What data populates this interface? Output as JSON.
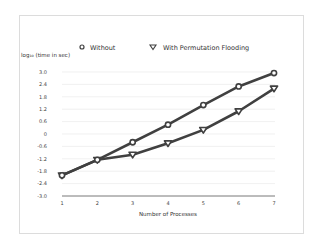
{
  "chart_data": {
    "type": "line",
    "title": "",
    "xlabel": "Number of Processes",
    "ylabel": "log10 (time in sec)",
    "ylabel_display": "log₁₀ (time in sec)",
    "x": [
      1,
      2,
      3,
      4,
      5,
      6,
      7
    ],
    "x_tick_labels": [
      "1",
      "2",
      "3",
      "4",
      "5",
      "6",
      "7"
    ],
    "y_ticks": [
      3.0,
      2.4,
      1.8,
      1.2,
      0.6,
      0,
      -0.6,
      -1.2,
      -1.8,
      -2.4,
      -3.0
    ],
    "y_tick_labels": [
      "3.0",
      "2.4",
      "1.8",
      "1.2",
      "0.6",
      "0",
      "-0.6",
      "-1.2",
      "-1.8",
      "-2.4",
      "-3.0"
    ],
    "ylim": [
      -3.0,
      3.0
    ],
    "xlim": [
      1,
      7
    ],
    "grid": true,
    "legend_position": "top",
    "series": [
      {
        "name": "Without",
        "marker": "circle",
        "color": "#404040",
        "values": [
          -2.0,
          -1.25,
          -0.4,
          0.45,
          1.4,
          2.3,
          2.95
        ]
      },
      {
        "name": "With Permutation Flooding",
        "marker": "triangle-down",
        "color": "#404040",
        "values": [
          -2.0,
          -1.25,
          -1.0,
          -0.45,
          0.2,
          1.1,
          2.2
        ]
      }
    ]
  },
  "legend": {
    "items": [
      {
        "label": "Without",
        "icon": "circle-marker-icon"
      },
      {
        "label": "With Permutation Flooding",
        "icon": "triangle-down-marker-icon"
      }
    ]
  },
  "colors": {
    "line": "#404040",
    "grid": "#e6e6e6",
    "axis": "#555555",
    "border": "#dcdcdc",
    "background": "#ffffff"
  }
}
